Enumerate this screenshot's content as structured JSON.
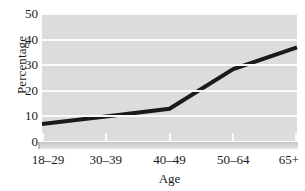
{
  "chart_data": {
    "type": "line",
    "title": "",
    "subtitle": "",
    "xlabel": "Age",
    "ylabel": "Percentage",
    "categories": [
      "18–29",
      "30–39",
      "40–49",
      "50–64",
      "65+"
    ],
    "values": [
      7,
      10,
      13,
      28.5,
      37
    ],
    "series": [
      {
        "name": "Percentage",
        "values": [
          7,
          10,
          13,
          28.5,
          37
        ],
        "color": "#1a1a1a",
        "line_width": 4,
        "markers": false
      }
    ],
    "ylim": [
      0,
      50
    ],
    "yticks": [
      0,
      10,
      20,
      30,
      40,
      50
    ],
    "ytick_labels": [
      "0",
      "10",
      "20",
      "30",
      "40",
      "50"
    ],
    "xtick_labels": [
      "18–29",
      "30–39",
      "40–49",
      "50–64",
      "65+"
    ],
    "grid": {
      "horizontal": true,
      "vertical": false,
      "color": "#fbfbfb"
    },
    "legend": {
      "visible": false,
      "position": "none",
      "entries": []
    },
    "plot_background": "#dcdcdc",
    "figure_background": "#ffffff",
    "annotations": []
  },
  "axes": {
    "y_title": "Percentage",
    "x_title": "Age",
    "y_ticks": [
      {
        "label": "50",
        "value": 50
      },
      {
        "label": "40",
        "value": 40
      },
      {
        "label": "30",
        "value": 30
      },
      {
        "label": "20",
        "value": 20
      },
      {
        "label": "10",
        "value": 10
      },
      {
        "label": "0",
        "value": 0
      }
    ],
    "x_ticks": [
      {
        "label": "18–29",
        "value": 0
      },
      {
        "label": "30–39",
        "value": 1
      },
      {
        "label": "40–49",
        "value": 2
      },
      {
        "label": "50–64",
        "value": 3
      },
      {
        "label": "65+",
        "value": 4
      }
    ]
  }
}
